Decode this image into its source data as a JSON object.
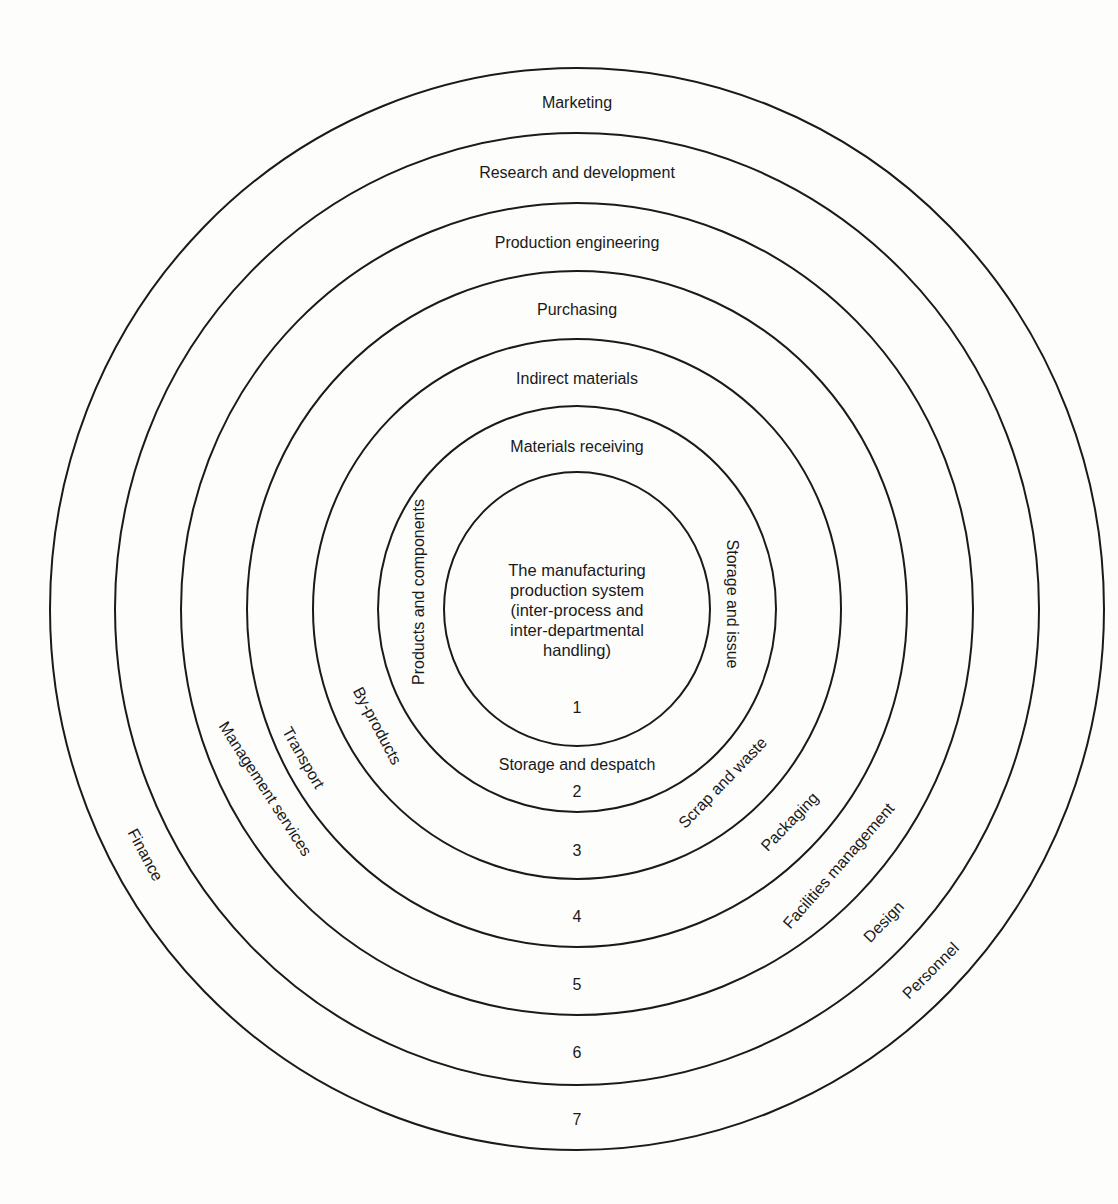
{
  "diagram": {
    "center": {
      "lines": [
        "The manufacturing",
        "production system",
        "(inter-process and",
        "inter-departmental",
        "handling)"
      ]
    },
    "rings": [
      {
        "number": "1",
        "rx": 133,
        "ry": 137
      },
      {
        "number": "2",
        "rx": 199,
        "ry": 203
      },
      {
        "number": "3",
        "rx": 264,
        "ry": 270
      },
      {
        "number": "4",
        "rx": 330,
        "ry": 338
      },
      {
        "number": "5",
        "rx": 396,
        "ry": 406
      },
      {
        "number": "6",
        "rx": 462,
        "ry": 476
      },
      {
        "number": "7",
        "rx": 527,
        "ry": 541
      }
    ],
    "top_labels": [
      "Marketing",
      "Research and development",
      "Production engineering",
      "Purchasing",
      "Indirect materials",
      "Materials receiving"
    ],
    "side_labels": {
      "products_and_components": "Products and components",
      "storage_and_issue": "Storage and issue",
      "storage_and_despatch": "Storage and despatch",
      "by_products": "By-products",
      "transport": "Transport",
      "management_services": "Management services",
      "finance": "Finance",
      "scrap_and_waste": "Scrap and waste",
      "packaging": "Packaging",
      "facilities_management": "Facilities management",
      "design": "Design",
      "personnel": "Personnel"
    },
    "stroke_color": "#1a1a1a",
    "background_color": "#fdfdfc"
  }
}
